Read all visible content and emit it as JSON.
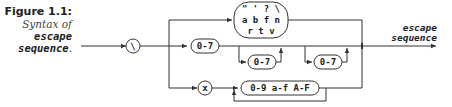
{
  "caption": {
    "figure": "Figure 1.1:",
    "line1": "Syntax of",
    "line2": "escape",
    "line3": "sequence",
    "period": "."
  },
  "diagram": {
    "backslash_terminal": "\\",
    "simple_escape_row1": "\" ' ? \\",
    "simple_escape_row2": "a b f n",
    "simple_escape_row3": "r t v",
    "octal_1": "0-7",
    "octal_2": "0-7",
    "octal_3": "0-7",
    "hex_prefix": "x",
    "hex_digits": "0-9 a-f A-F",
    "output_label_line1": "escape",
    "output_label_line2": "sequence"
  }
}
